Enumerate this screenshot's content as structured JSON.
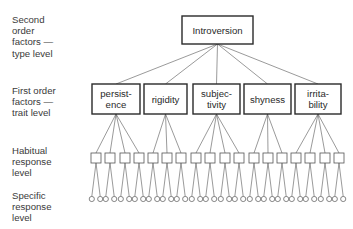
{
  "levels": [
    {
      "id": "type",
      "label": "Second\norder\nfactors —\ntype level",
      "top": 14
    },
    {
      "id": "trait",
      "label": "First order\nfactors —\ntrait level",
      "top": 85
    },
    {
      "id": "habitual",
      "label": "Habitual\nresponse\nlevel",
      "top": 145
    },
    {
      "id": "specific",
      "label": "Specific\nresponse\nlevel",
      "top": 190
    }
  ],
  "root": {
    "label": "Introversion",
    "x": 182,
    "y": 16,
    "w": 71,
    "h": 28
  },
  "traits": [
    {
      "lines": [
        "persist-",
        "ence"
      ],
      "x": 92,
      "w": 48,
      "habits": [
        96,
        110,
        125,
        139
      ]
    },
    {
      "lines": [
        "rigidity"
      ],
      "x": 144,
      "w": 43,
      "habits": [
        153,
        167,
        181
      ]
    },
    {
      "lines": [
        "subjec-",
        "tivity"
      ],
      "x": 193,
      "w": 47,
      "habits": [
        196,
        210,
        225,
        239
      ]
    },
    {
      "lines": [
        "shyness"
      ],
      "x": 244,
      "w": 47,
      "habits": [
        254,
        268,
        282
      ]
    },
    {
      "lines": [
        "irrita-",
        "bility"
      ],
      "x": 295,
      "w": 46,
      "habits": [
        296,
        310,
        325,
        339
      ]
    }
  ],
  "trait_box": {
    "y": 84,
    "h": 30
  },
  "habit_row": {
    "y": 153,
    "size": 10
  },
  "specific_row": {
    "y": 199,
    "r": 2.6,
    "spread": 4.2
  },
  "colors": {
    "line": "#555555",
    "box": "#2a2a2a",
    "text": "#2a2a2a"
  }
}
